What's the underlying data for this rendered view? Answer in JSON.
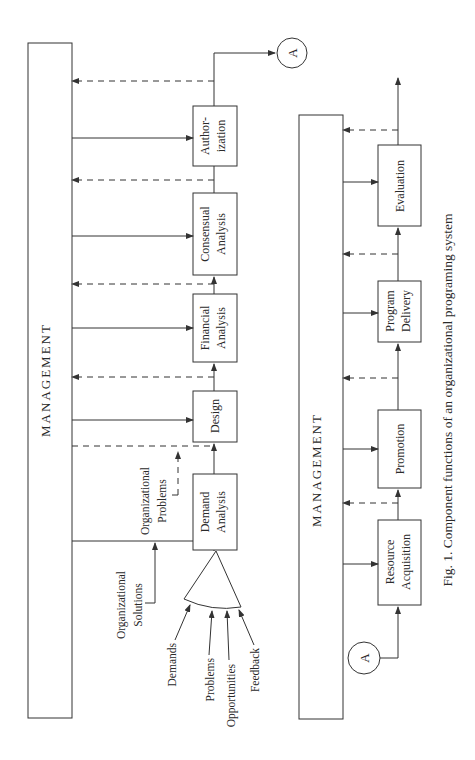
{
  "diagram": {
    "caption": "Fig. 1. Component functions of an organizational programing system",
    "top_panel": {
      "management_label": "MANAGEMENT",
      "boxes": [
        {
          "id": "demand-analysis",
          "lines": [
            "Demand",
            "Analysis"
          ]
        },
        {
          "id": "design",
          "lines": [
            "Design"
          ]
        },
        {
          "id": "financial-analysis",
          "lines": [
            "Financial",
            "Analysis"
          ]
        },
        {
          "id": "consensual-analysis",
          "lines": [
            "Consensual",
            "Analysis"
          ]
        },
        {
          "id": "authorization",
          "lines": [
            "Author-",
            "ization"
          ]
        }
      ],
      "connector": "A",
      "org_problems": [
        "Organizational",
        "Problems"
      ],
      "org_solutions": [
        "Organizational",
        "Solutions"
      ],
      "inputs": [
        "Demands",
        "Problems",
        "Opportunities",
        "Feedback"
      ]
    },
    "bottom_panel": {
      "management_label": "MANAGEMENT",
      "boxes": [
        {
          "id": "resource-acquisition",
          "lines": [
            "Resource",
            "Acquisition"
          ]
        },
        {
          "id": "promotion",
          "lines": [
            "Promotion"
          ]
        },
        {
          "id": "program-delivery",
          "lines": [
            "Program",
            "Delivery"
          ]
        },
        {
          "id": "evaluation",
          "lines": [
            "Evaluation"
          ]
        }
      ],
      "connector": "A"
    },
    "colors": {
      "ink": "#333333",
      "background": "#ffffff"
    }
  }
}
